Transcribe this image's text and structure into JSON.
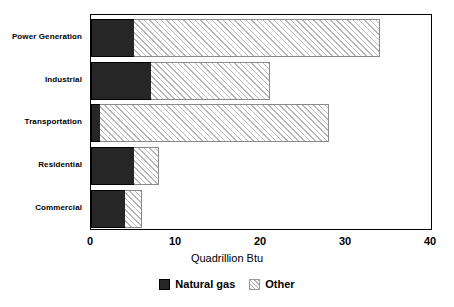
{
  "chart_data": {
    "type": "bar",
    "orientation": "horizontal",
    "stacked": true,
    "title": "",
    "xlabel": "Quadrillion Btu",
    "ylabel": "",
    "xlim": [
      0,
      40
    ],
    "xticks": [
      "0",
      "10",
      "20",
      "30",
      "40"
    ],
    "grid": false,
    "legend_position": "bottom-center",
    "categories": [
      "Power Generation",
      "Industrial",
      "Transportation",
      "Residential",
      "Commercial"
    ],
    "series": [
      {
        "name": "Natural gas",
        "color": "#262626",
        "fill": "solid",
        "values": [
          5,
          7,
          1,
          5,
          4
        ]
      },
      {
        "name": "Other",
        "color": "#b8b8b8",
        "fill": "diagonal-hatch",
        "values": [
          29,
          14,
          27,
          3,
          2
        ]
      }
    ],
    "totals": [
      34,
      21,
      28,
      8,
      6
    ]
  },
  "legend": {
    "items": [
      {
        "label": "Natural gas",
        "swatch": "solid-dark-swatch"
      },
      {
        "label": "Other",
        "swatch": "hatched-light-swatch"
      }
    ]
  }
}
